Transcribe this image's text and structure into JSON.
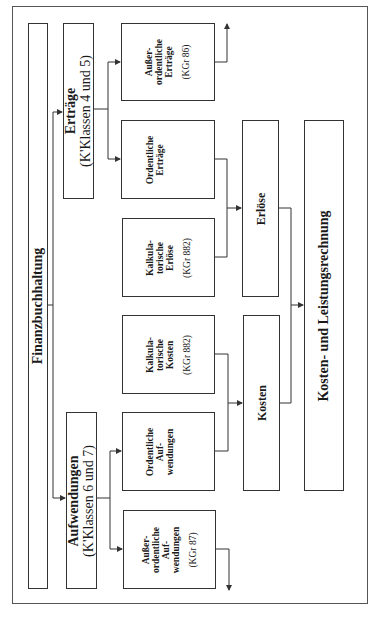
{
  "diagram": {
    "orientation": "rotated -90deg",
    "root": {
      "label": "Finanzbuchhaltung"
    },
    "categories": [
      {
        "id": "ertraege",
        "title": "Erträge",
        "subtitle": "(K'Klassen 4 und 5)"
      },
      {
        "id": "aufwendungen",
        "title": "Aufwendungen",
        "subtitle": "(K'Klassen 6 und 7)"
      }
    ],
    "items": [
      {
        "id": "ao-ertraege",
        "lines": [
          "Außer-",
          "ordentliche",
          "Erträge"
        ],
        "code": "(KGr 86)"
      },
      {
        "id": "o-ertraege",
        "lines": [
          "Ordentliche",
          "Erträge"
        ],
        "code": ""
      },
      {
        "id": "kalk-erloese",
        "lines": [
          "Kalkula-",
          "torische",
          "Erlöse"
        ],
        "code": "(KGr 882)"
      },
      {
        "id": "kalk-kosten",
        "lines": [
          "Kalkula-",
          "torische",
          "Kosten"
        ],
        "code": "(KGr 882)"
      },
      {
        "id": "o-aufwendungen",
        "lines": [
          "Ordentliche",
          "Auf-",
          "wendungen"
        ],
        "code": ""
      },
      {
        "id": "ao-aufwendungen",
        "lines": [
          "Außer-",
          "ordentliche",
          "Auf-",
          "wendungen"
        ],
        "code": "(KGr 87)"
      }
    ],
    "aggregates": [
      {
        "id": "erloese",
        "label": "Erlöse"
      },
      {
        "id": "kosten",
        "label": "Kosten"
      }
    ],
    "result": {
      "label": "Kosten- und Leistungsrechnung"
    },
    "colors": {
      "line": "#333333",
      "frame": "#555555",
      "background": "#ffffff"
    }
  }
}
